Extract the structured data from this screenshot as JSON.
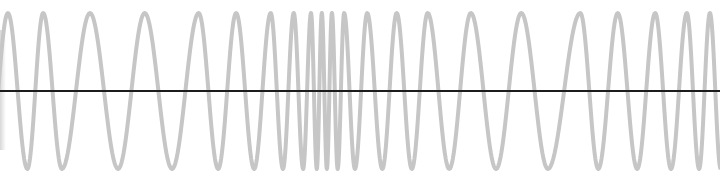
{
  "diagram": {
    "type": "frequency-modulated-waveform",
    "colors": {
      "wave": "#c6c6c6",
      "axis": "#1c1c1c",
      "background": "#ffffff"
    },
    "time_axis": {
      "range": [
        0,
        1
      ]
    },
    "amplitude": {
      "range": [
        -1,
        1
      ]
    },
    "extrema": [
      {
        "t": 0.011,
        "v": 1
      },
      {
        "t": 0.038,
        "v": -1
      },
      {
        "t": 0.06,
        "v": 1
      },
      {
        "t": 0.086,
        "v": -1
      },
      {
        "t": 0.125,
        "v": 1
      },
      {
        "t": 0.164,
        "v": -1
      },
      {
        "t": 0.201,
        "v": 1
      },
      {
        "t": 0.239,
        "v": -1
      },
      {
        "t": 0.276,
        "v": 1
      },
      {
        "t": 0.303,
        "v": -1
      },
      {
        "t": 0.328,
        "v": 1
      },
      {
        "t": 0.353,
        "v": -1
      },
      {
        "t": 0.376,
        "v": 1
      },
      {
        "t": 0.393,
        "v": -1
      },
      {
        "t": 0.408,
        "v": 1
      },
      {
        "t": 0.421,
        "v": -1
      },
      {
        "t": 0.432,
        "v": 1
      },
      {
        "t": 0.44,
        "v": -1
      },
      {
        "t": 0.447,
        "v": 1
      },
      {
        "t": 0.454,
        "v": -1
      },
      {
        "t": 0.461,
        "v": 1
      },
      {
        "t": 0.469,
        "v": -1
      },
      {
        "t": 0.478,
        "v": 1
      },
      {
        "t": 0.493,
        "v": -1
      },
      {
        "t": 0.51,
        "v": 1
      },
      {
        "t": 0.531,
        "v": -1
      },
      {
        "t": 0.551,
        "v": 1
      },
      {
        "t": 0.572,
        "v": -1
      },
      {
        "t": 0.594,
        "v": 1
      },
      {
        "t": 0.624,
        "v": -1
      },
      {
        "t": 0.654,
        "v": 1
      },
      {
        "t": 0.689,
        "v": -1
      },
      {
        "t": 0.724,
        "v": 1
      },
      {
        "t": 0.761,
        "v": -1
      },
      {
        "t": 0.806,
        "v": 1
      },
      {
        "t": 0.831,
        "v": -1
      },
      {
        "t": 0.858,
        "v": 1
      },
      {
        "t": 0.885,
        "v": -1
      },
      {
        "t": 0.91,
        "v": 1
      },
      {
        "t": 0.932,
        "v": -1
      },
      {
        "t": 0.954,
        "v": 1
      },
      {
        "t": 0.971,
        "v": -1
      },
      {
        "t": 0.986,
        "v": 1
      }
    ]
  }
}
